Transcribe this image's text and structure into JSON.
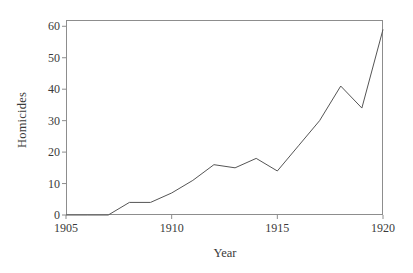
{
  "chart_data": {
    "type": "line",
    "title": "",
    "xlabel": "Year",
    "ylabel": "Homicides",
    "xlim": [
      1905,
      1920
    ],
    "ylim": [
      0,
      62
    ],
    "grid": false,
    "legend": null,
    "x": [
      1905,
      1906,
      1907,
      1908,
      1909,
      1910,
      1911,
      1912,
      1913,
      1914,
      1915,
      1916,
      1917,
      1918,
      1919,
      1920
    ],
    "values": [
      0,
      0,
      0,
      4,
      4,
      7,
      11,
      16,
      15,
      18,
      14,
      22,
      30,
      41,
      34,
      59
    ],
    "series": [
      {
        "name": "Homicides",
        "values": [
          0,
          0,
          0,
          4,
          4,
          7,
          11,
          16,
          15,
          18,
          14,
          22,
          30,
          41,
          34,
          59
        ]
      }
    ],
    "xticks": [
      1905,
      1910,
      1915,
      1920
    ],
    "xtick_labels": [
      "1905",
      "1910",
      "1915",
      "1920"
    ],
    "yticks": [
      0,
      10,
      20,
      30,
      40,
      50,
      60
    ],
    "ytick_labels": [
      "0",
      "10",
      "20",
      "30",
      "40",
      "50",
      "60"
    ],
    "line_color": "#555555",
    "axis_color": "#8d8d8d",
    "background_color": "#ffffff"
  }
}
